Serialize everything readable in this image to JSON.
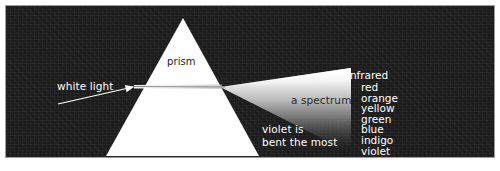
{
  "figure": {
    "panel_background": "#1b1b1b",
    "prism_color": "#ffffff"
  },
  "labels": {
    "prism": "prism",
    "white_light": "white light",
    "spectrum": "a spectrum",
    "violet_note_line1": "violet is",
    "violet_note_line2": "bent the most"
  },
  "spectrum_bands": [
    {
      "name": "infrared",
      "class": "edge ir"
    },
    {
      "name": "red",
      "class": "inner"
    },
    {
      "name": "orange",
      "class": "inner"
    },
    {
      "name": "yellow",
      "class": "inner"
    },
    {
      "name": "green",
      "class": "inner"
    },
    {
      "name": "blue",
      "class": "inner"
    },
    {
      "name": "indigo",
      "class": "inner"
    },
    {
      "name": "violet",
      "class": "inner"
    },
    {
      "name": "ultraviolet",
      "class": "edge uv"
    }
  ]
}
